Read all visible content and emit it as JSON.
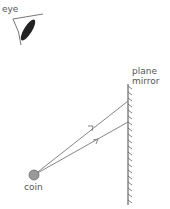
{
  "diagram": {
    "type": "ray-diagram",
    "labels": {
      "eye": "eye",
      "mirror_line1": "plane",
      "mirror_line2": "mirror",
      "coin": "coin"
    },
    "colors": {
      "ray": "#777777",
      "mirror": "#666666",
      "coin_fill": "#999999",
      "coin_stroke": "#6e6e6e",
      "eye_outline": "#777777",
      "eye_lens": "#222222",
      "label": "#555555"
    },
    "coin": {
      "cx": 34,
      "cy": 175,
      "r": 5
    },
    "mirror": {
      "x": 128,
      "y1": 84,
      "y2": 205
    },
    "rays": [
      {
        "from": [
          34,
          175
        ],
        "to": [
          128,
          101
        ]
      },
      {
        "from": [
          34,
          175
        ],
        "to": [
          128,
          122
        ]
      }
    ]
  }
}
